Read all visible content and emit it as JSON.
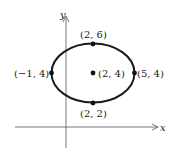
{
  "diagram": {
    "type": "ellipse-on-coordinate-axes",
    "axes": {
      "x_label": "x",
      "y_label": "y"
    },
    "ellipse": {
      "center": "(2, 4)",
      "semi_major_x": 3,
      "semi_minor_y": 2
    },
    "points": {
      "top": "(2, 6)",
      "bottom": "(2, 2)",
      "left": "(−1, 4)",
      "right": "(5, 4)",
      "center": "(2, 4)"
    },
    "colors": {
      "stroke": "#1a1a1a",
      "axis": "#555555",
      "background": "#ffffff"
    }
  }
}
